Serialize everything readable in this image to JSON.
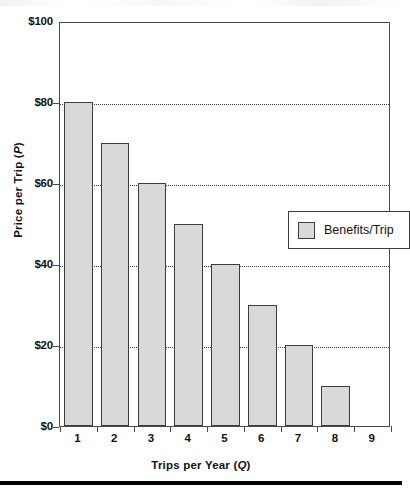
{
  "chart_data": {
    "type": "bar",
    "title": "",
    "subtitle": "",
    "xlabel_text": "Trips per Year (",
    "xlabel_var": "Q",
    "xlabel_close": ")",
    "ylabel_text": "Price per Trip (",
    "ylabel_var": "P",
    "ylabel_close": ")",
    "categories": [
      "1",
      "2",
      "3",
      "4",
      "5",
      "6",
      "7",
      "8",
      "9"
    ],
    "values": [
      80,
      70,
      60,
      50,
      40,
      30,
      20,
      10,
      0
    ],
    "series": [
      {
        "name": "Benefits/Trip",
        "values": [
          80,
          70,
          60,
          50,
          40,
          30,
          20,
          10,
          0
        ]
      }
    ],
    "ylim": [
      0,
      100
    ],
    "ytick_values": [
      0,
      20,
      40,
      60,
      80,
      100
    ],
    "ytick_labels": [
      "$0",
      "$20",
      "$40",
      "$60",
      "$80",
      "$100"
    ],
    "gridlines_y": [
      20,
      40,
      60,
      80
    ],
    "grid": "horizontal-dotted",
    "legend_position": "inside-right",
    "bar_fill_color": "#d9d9d9",
    "bar_edge_color": "#3d3d3d",
    "axis_color": "#4a4a4a",
    "background_color": "#ffffff"
  },
  "legend": {
    "entries": [
      {
        "label": "Benefits/Trip",
        "color": "#d9d9d9"
      }
    ]
  },
  "ticks": {
    "y": [
      {
        "label": "$100",
        "value": 100
      },
      {
        "label": "$80",
        "value": 80
      },
      {
        "label": "$60",
        "value": 60
      },
      {
        "label": "$40",
        "value": 40
      },
      {
        "label": "$20",
        "value": 20
      },
      {
        "label": "$0",
        "value": 0
      }
    ],
    "x": [
      "1",
      "2",
      "3",
      "4",
      "5",
      "6",
      "7",
      "8",
      "9"
    ]
  }
}
